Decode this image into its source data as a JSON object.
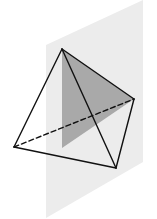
{
  "figure": {
    "colors": {
      "background": "#ffffff",
      "plane": "#ececec",
      "section": "#a9a9a9",
      "edge": "#111111"
    },
    "plane": {
      "points": "46,45 143,0 143,162 46,218"
    },
    "section": {
      "points": "62,49 134,99 62,148"
    },
    "vertices": {
      "top": [
        62,
        49
      ],
      "right": [
        134,
        99
      ],
      "left": [
        14,
        147
      ],
      "bottom": [
        116,
        168
      ]
    },
    "edges": {
      "solid": [
        [
          62,
          49,
          14,
          147
        ],
        [
          62,
          49,
          134,
          99
        ],
        [
          62,
          49,
          116,
          168
        ],
        [
          14,
          147,
          116,
          168
        ],
        [
          134,
          99,
          116,
          168
        ]
      ],
      "dashed": [
        [
          14,
          147,
          134,
          99
        ]
      ]
    }
  }
}
